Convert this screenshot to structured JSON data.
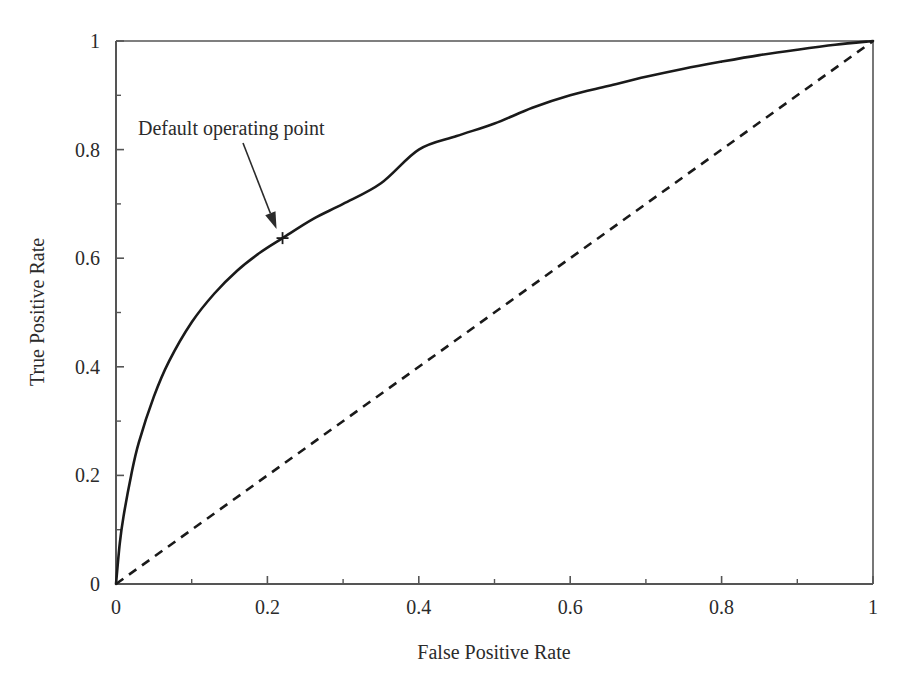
{
  "chart_data": {
    "type": "line",
    "title": "",
    "xlabel": "False Positive Rate",
    "ylabel": "True Positive Rate",
    "xlim": [
      0,
      1
    ],
    "ylim": [
      0,
      1
    ],
    "grid": false,
    "legend": "none",
    "xticks": [
      "0",
      "0.2",
      "0.4",
      "0.6",
      "0.8",
      "1"
    ],
    "xtick_values": [
      0,
      0.2,
      0.4,
      0.6,
      0.8,
      1
    ],
    "yticks": [
      "0",
      "0.2",
      "0.4",
      "0.6",
      "0.8",
      "1"
    ],
    "ytick_values": [
      0,
      0.2,
      0.4,
      0.6,
      0.8,
      1
    ],
    "minor_ticks": true,
    "series": [
      {
        "name": "ROC curve",
        "style": "solid",
        "color": "#1a1a1a",
        "x": [
          0,
          0.005,
          0.01,
          0.02,
          0.03,
          0.05,
          0.07,
          0.1,
          0.13,
          0.16,
          0.19,
          0.22,
          0.26,
          0.3,
          0.35,
          0.4,
          0.45,
          0.5,
          0.55,
          0.6,
          0.65,
          0.7,
          0.75,
          0.8,
          0.85,
          0.9,
          0.95,
          1
        ],
        "y": [
          0,
          0.075,
          0.125,
          0.2,
          0.26,
          0.345,
          0.41,
          0.482,
          0.535,
          0.577,
          0.61,
          0.637,
          0.672,
          0.7,
          0.738,
          0.8,
          0.825,
          0.848,
          0.877,
          0.9,
          0.917,
          0.934,
          0.949,
          0.962,
          0.974,
          0.984,
          0.993,
          1
        ]
      },
      {
        "name": "chance diagonal",
        "style": "dashed",
        "color": "#1a1a1a",
        "x": [
          0,
          1
        ],
        "y": [
          0,
          1
        ]
      }
    ],
    "annotations": [
      {
        "label": "Default operating point",
        "marker": "plus",
        "point_x": 0.22,
        "point_y": 0.637,
        "text_x": 0.03,
        "text_y": 0.835
      }
    ]
  },
  "axes": {
    "x_title": "False Positive Rate",
    "y_title": "True Positive Rate"
  }
}
